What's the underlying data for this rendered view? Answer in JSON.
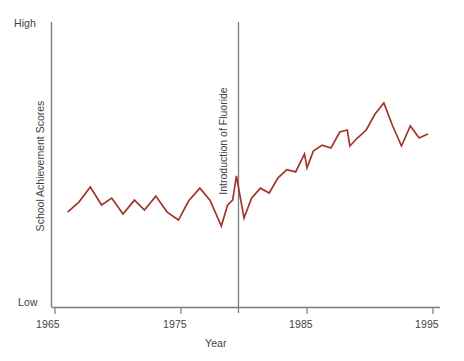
{
  "chart_data": {
    "type": "line",
    "title": "",
    "xlabel": "Year",
    "ylabel": "School Achievement Scores",
    "xlim": [
      1965,
      1995
    ],
    "ylim": [
      0,
      1
    ],
    "grid": false,
    "legend": null,
    "y_axis_tick_labels": [
      "Low",
      "High"
    ],
    "y_axis_low_label": "Low",
    "y_axis_high_label": "High",
    "x_axis_tick_labels": [
      "1965",
      "1975",
      "1985",
      "1995"
    ],
    "x_axis_tick_values": [
      1965,
      1975,
      1985,
      1995
    ],
    "line_color": "#a3342a",
    "axis_color": "#7d7d7d",
    "annotations": [
      {
        "name": "introduction-of-fluoride",
        "label": "Introduction of Fluoride",
        "x": 1979.5,
        "type": "vertical-line",
        "color": "#7d7d7d"
      }
    ],
    "series": [
      {
        "name": "School Achievement Scores",
        "color": "#a3342a",
        "x": [
          1966.0,
          1966.9,
          1967.8,
          1968.7,
          1969.5,
          1970.4,
          1971.3,
          1972.1,
          1973.0,
          1973.9,
          1974.8,
          1975.6,
          1976.5,
          1977.3,
          1978.2,
          1978.7,
          1979.1,
          1979.4,
          1980.0,
          1980.6,
          1981.3,
          1982.0,
          1982.7,
          1983.4,
          1984.1,
          1984.8,
          1985.0,
          1985.5,
          1986.2,
          1986.9,
          1987.6,
          1988.2,
          1988.4,
          1989.0,
          1989.7,
          1990.4,
          1991.1,
          1991.8,
          1992.5,
          1993.2,
          1993.9,
          1994.6
        ],
        "values": [
          0.333,
          0.368,
          0.421,
          0.358,
          0.382,
          0.326,
          0.375,
          0.34,
          0.389,
          0.333,
          0.305,
          0.372,
          0.417,
          0.375,
          0.284,
          0.358,
          0.375,
          0.46,
          0.312,
          0.382,
          0.417,
          0.4,
          0.453,
          0.482,
          0.474,
          0.537,
          0.488,
          0.547,
          0.568,
          0.558,
          0.614,
          0.621,
          0.565,
          0.593,
          0.621,
          0.677,
          0.716,
          0.635,
          0.565,
          0.635,
          0.593,
          0.607
        ]
      }
    ]
  },
  "labels": {
    "high": "High",
    "low": "Low",
    "year": "Year",
    "y_title": "School Achievement Scores",
    "annotation": "Introduction of Fluoride",
    "tick_1965": "1965",
    "tick_1975": "1975",
    "tick_1985": "1985",
    "tick_1995": "1995"
  }
}
